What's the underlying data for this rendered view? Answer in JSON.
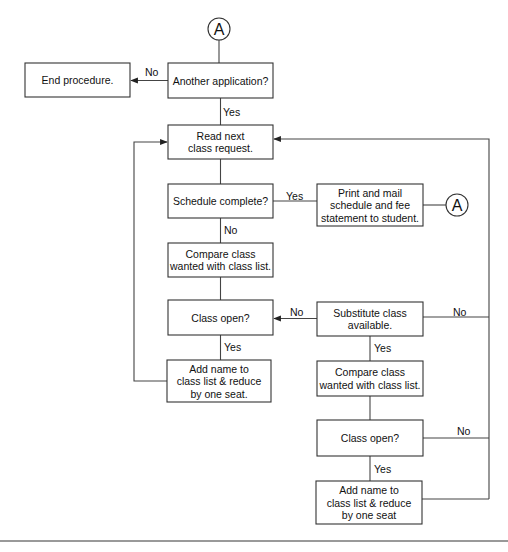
{
  "diagram": {
    "type": "flowchart",
    "nodes": [
      {
        "id": "conn_top",
        "kind": "connector",
        "label": "A"
      },
      {
        "id": "another_app",
        "kind": "decision",
        "lines": [
          "Another application?"
        ]
      },
      {
        "id": "end",
        "kind": "terminal",
        "lines": [
          "End procedure."
        ]
      },
      {
        "id": "read_next",
        "kind": "process",
        "lines": [
          "Read next",
          "class request."
        ]
      },
      {
        "id": "sched_complete",
        "kind": "decision",
        "lines": [
          "Schedule complete?"
        ]
      },
      {
        "id": "print_mail",
        "kind": "process",
        "lines": [
          "Print and mail",
          "schedule and fee",
          "statement  to student."
        ]
      },
      {
        "id": "conn_right",
        "kind": "connector",
        "label": "A"
      },
      {
        "id": "compare1",
        "kind": "process",
        "lines": [
          "Compare class",
          "wanted with class list."
        ]
      },
      {
        "id": "class_open1",
        "kind": "decision",
        "lines": [
          "Class open?"
        ]
      },
      {
        "id": "add_name1",
        "kind": "process",
        "lines": [
          "Add name to",
          "class list & reduce",
          "by one seat."
        ]
      },
      {
        "id": "substitute",
        "kind": "decision",
        "lines": [
          "Substitute class",
          "available."
        ]
      },
      {
        "id": "compare2",
        "kind": "process",
        "lines": [
          "Compare class",
          "wanted with class list."
        ]
      },
      {
        "id": "class_open2",
        "kind": "decision",
        "lines": [
          "Class open?"
        ]
      },
      {
        "id": "add_name2",
        "kind": "process",
        "lines": [
          "Add name to",
          "class list & reduce",
          "by one seat"
        ]
      }
    ],
    "edges": [
      {
        "from": "conn_top",
        "to": "another_app",
        "label": ""
      },
      {
        "from": "another_app",
        "to": "end",
        "label": "No"
      },
      {
        "from": "another_app",
        "to": "read_next",
        "label": "Yes"
      },
      {
        "from": "read_next",
        "to": "sched_complete",
        "label": ""
      },
      {
        "from": "sched_complete",
        "to": "print_mail",
        "label": "Yes"
      },
      {
        "from": "print_mail",
        "to": "conn_right",
        "label": ""
      },
      {
        "from": "sched_complete",
        "to": "compare1",
        "label": "No"
      },
      {
        "from": "compare1",
        "to": "class_open1",
        "label": ""
      },
      {
        "from": "class_open1",
        "to": "add_name1",
        "label": "Yes"
      },
      {
        "from": "add_name1",
        "to": "read_next",
        "label": ""
      },
      {
        "from": "class_open1",
        "to": "substitute",
        "label": "No"
      },
      {
        "from": "substitute",
        "to": "compare2",
        "label": "Yes"
      },
      {
        "from": "substitute",
        "to": "read_next",
        "label": "No"
      },
      {
        "from": "compare2",
        "to": "class_open2",
        "label": ""
      },
      {
        "from": "class_open2",
        "to": "add_name2",
        "label": "Yes"
      },
      {
        "from": "class_open2",
        "to": "read_next",
        "label": "No"
      },
      {
        "from": "add_name2",
        "to": "read_next",
        "label": ""
      }
    ]
  }
}
